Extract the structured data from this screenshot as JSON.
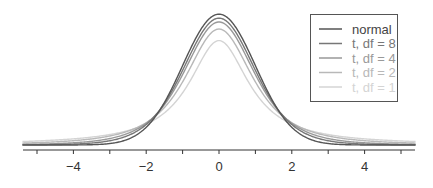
{
  "chart_data": {
    "type": "line",
    "title": "",
    "xlabel": "",
    "ylabel": "",
    "xlim": [
      -5.4,
      5.4
    ],
    "ylim": [
      0,
      0.4
    ],
    "grid": false,
    "legend_position": "top-right",
    "x_ticks": [
      -4,
      -2,
      0,
      2,
      4
    ],
    "x_tick_labels": [
      "−4",
      "−2",
      "0",
      "2",
      "4"
    ],
    "series": [
      {
        "name": "normal",
        "distribution": "normal",
        "peak": 0.399,
        "color": "#555555"
      },
      {
        "name": "t, df = 8",
        "distribution": "t",
        "df": 8,
        "peak": 0.387,
        "color": "#777777"
      },
      {
        "name": "t, df = 4",
        "distribution": "t",
        "df": 4,
        "peak": 0.375,
        "color": "#999999"
      },
      {
        "name": "t, df = 2",
        "distribution": "t",
        "df": 2,
        "peak": 0.354,
        "color": "#b8b8b8"
      },
      {
        "name": "t, df = 1",
        "distribution": "t",
        "df": 1,
        "peak": 0.318,
        "color": "#d4d4d4"
      }
    ]
  },
  "legend": {
    "items": [
      {
        "label": "normal",
        "color": "#555555"
      },
      {
        "label": "t, df = 8",
        "color": "#777777"
      },
      {
        "label": "t, df = 4",
        "color": "#999999"
      },
      {
        "label": "t, df = 2",
        "color": "#b8b8b8"
      },
      {
        "label": "t, df = 1",
        "color": "#d4d4d4"
      }
    ]
  }
}
